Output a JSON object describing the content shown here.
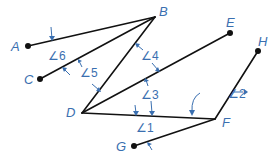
{
  "diagram": {
    "points": {
      "A": {
        "label": "A",
        "x": 28,
        "y": 46,
        "lx": 11,
        "ly": 51
      },
      "B": {
        "label": "B",
        "x": 155,
        "y": 17,
        "lx": 159,
        "ly": 16
      },
      "C": {
        "label": "C",
        "x": 40,
        "y": 79,
        "lx": 24,
        "ly": 84
      },
      "D": {
        "label": "D",
        "x": 82,
        "y": 113,
        "lx": 66,
        "ly": 117
      },
      "E": {
        "label": "E",
        "x": 230,
        "y": 33,
        "lx": 226,
        "ly": 27
      },
      "F": {
        "label": "F",
        "x": 215,
        "y": 119,
        "lx": 222,
        "ly": 127
      },
      "G": {
        "label": "G",
        "x": 134,
        "y": 146,
        "lx": 116,
        "ly": 151
      },
      "H": {
        "label": "H",
        "x": 258,
        "y": 51,
        "lx": 258,
        "ly": 46
      }
    },
    "segments": [
      [
        "A",
        "B"
      ],
      [
        "C",
        "B"
      ],
      [
        "D",
        "B"
      ],
      [
        "D",
        "E"
      ],
      [
        "D",
        "F"
      ],
      [
        "G",
        "F"
      ],
      [
        "F",
        "H"
      ]
    ],
    "angles": [
      {
        "label": "∠1",
        "x": 136,
        "y": 132
      },
      {
        "label": "∠2",
        "x": 228,
        "y": 98
      },
      {
        "label": "∠3",
        "x": 141,
        "y": 99
      },
      {
        "label": "∠4",
        "x": 141,
        "y": 60
      },
      {
        "label": "∠5",
        "x": 80,
        "y": 77
      },
      {
        "label": "∠6",
        "x": 48,
        "y": 60
      }
    ],
    "colors": {
      "line": "#111111",
      "annotation": "#3a6fb0"
    }
  }
}
